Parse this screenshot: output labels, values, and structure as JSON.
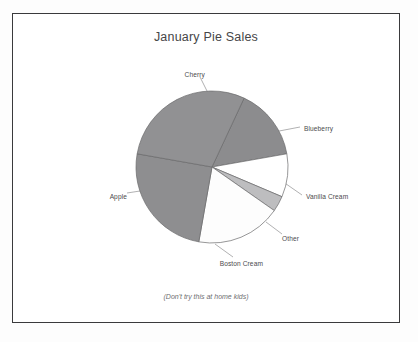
{
  "chart_data": {
    "type": "pie",
    "title": "January Pie Sales",
    "footnote": "(Don't try this at home kids)",
    "categories": [
      "Blueberry",
      "Vanilla Cream",
      "Other",
      "Boston Cream",
      "Apple",
      "Cherry"
    ],
    "values": [
      15,
      9,
      3,
      18,
      25,
      30
    ],
    "units": "percent",
    "start_angle_deg": -65,
    "direction": "clockwise",
    "legend": "none",
    "labels_position": "outside-with-leader-lines",
    "grid": false,
    "slices": [
      {
        "label": "Blueberry",
        "value": 15,
        "color": "#8c8c8e",
        "start_deg": -65,
        "end_deg": -10,
        "label_x": 303,
        "label_y": 124,
        "leader_from_x": 273,
        "leader_from_y": 131,
        "leader_to_x": 299,
        "leader_to_y": 126
      },
      {
        "label": "Vanilla Cream",
        "value": 9,
        "color": "#ffffff",
        "start_deg": -10,
        "end_deg": 23,
        "label_x": 305,
        "label_y": 192,
        "leader_from_x": 278,
        "leader_from_y": 178,
        "leader_to_x": 301,
        "leader_to_y": 194
      },
      {
        "label": "Other",
        "value": 3,
        "color": "#bdbdbf",
        "start_deg": 23,
        "end_deg": 35,
        "label_x": 281,
        "label_y": 234,
        "leader_from_x": 265,
        "leader_from_y": 221,
        "leader_to_x": 281,
        "leader_to_y": 233
      },
      {
        "label": "Boston Cream",
        "value": 18,
        "color": "#fdfdfd",
        "start_deg": 35,
        "end_deg": 100,
        "label_x": 226,
        "label_y": 259,
        "leader_from_x": 214,
        "leader_from_y": 243,
        "leader_to_x": 232,
        "leader_to_y": 256
      },
      {
        "label": "Apple",
        "value": 25,
        "color": "#8e8e90",
        "start_deg": 100,
        "end_deg": 190,
        "label_x": 108,
        "label_y": 192,
        "leader_from_x": 139,
        "leader_from_y": 190,
        "leader_to_x": 126,
        "leader_to_y": 192
      },
      {
        "label": "Cherry",
        "value": 30,
        "color": "#919193",
        "start_deg": 190,
        "end_deg": 295,
        "label_x": 186,
        "label_y": 70,
        "leader_from_x": 207,
        "leader_from_y": 92,
        "leader_to_x": 199,
        "leader_to_y": 76
      }
    ]
  },
  "geometry": {
    "center_x": 211,
    "center_y": 166,
    "radius": 76
  },
  "styles": {
    "frame_border": "#3a3a3c",
    "slice_outline": "#6a6a6c",
    "title_color": "#464648",
    "label_color": "#4b4b4d"
  }
}
